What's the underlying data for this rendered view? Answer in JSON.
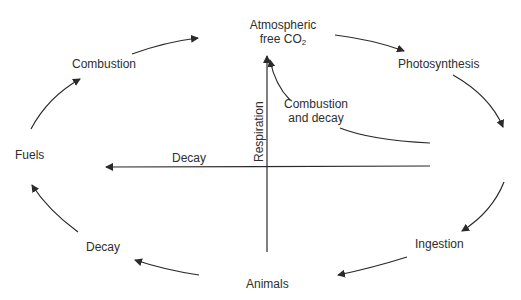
{
  "diagram": {
    "nodes": {
      "atmosphere_line1": "Atmospheric",
      "atmosphere_line2_prefix": "free CO",
      "atmosphere_sub": "2",
      "photosynthesis": "Photosynthesis",
      "ingestion": "Ingestion",
      "animals": "Animals",
      "decay_lower": "Decay",
      "fuels": "Fuels",
      "combustion": "Combustion"
    },
    "inner_labels": {
      "respiration": "Respiration",
      "combustion_decay_line1": "Combustion",
      "combustion_decay_line2": "and decay",
      "decay_axis": "Decay"
    },
    "colors": {
      "line": "#2a2a2a",
      "text": "#2e2e2e",
      "background": "#ffffff"
    },
    "edges": [
      {
        "from": "Atmospheric free CO2",
        "to": "Photosynthesis"
      },
      {
        "from": "Photosynthesis",
        "to": "Ingestion"
      },
      {
        "from": "Ingestion",
        "to": "Animals"
      },
      {
        "from": "Animals",
        "to": "Decay"
      },
      {
        "from": "Decay",
        "to": "Fuels"
      },
      {
        "from": "Fuels",
        "to": "Combustion"
      },
      {
        "from": "Combustion",
        "to": "Atmospheric free CO2"
      },
      {
        "from": "Animals",
        "to": "Atmospheric free CO2",
        "label": "Respiration"
      },
      {
        "from": "Right",
        "to": "Fuels",
        "label": "Decay"
      },
      {
        "from": "Right",
        "to": "Atmospheric free CO2",
        "label": "Combustion and decay"
      }
    ]
  }
}
